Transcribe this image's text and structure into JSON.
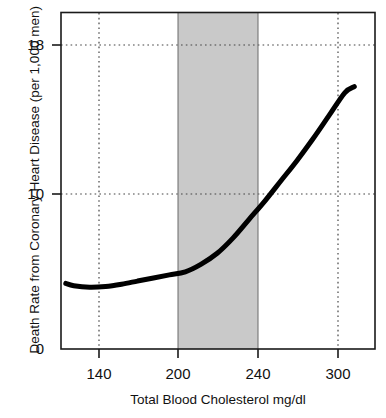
{
  "chart_data": {
    "type": "line",
    "title": "",
    "xlabel": "Total Blood Cholesterol mg/dl",
    "ylabel": "Death Rate from Coronary Heart Disease (per 1,000 men)",
    "xlim": [
      122,
      319
    ],
    "ylim": [
      0,
      21.8
    ],
    "xticks": [
      140,
      200,
      240,
      300
    ],
    "xticklabels": [
      "140",
      "200",
      "240",
      "300"
    ],
    "yticks": [
      0,
      10,
      18
    ],
    "yticklabels": [
      "0",
      "10",
      "18"
    ],
    "grid": "dotted gridlines at x ticks 140 and 300, and at y ticks 10 and 18",
    "legend": "none",
    "series": [
      {
        "name": "Death rate from coronary heart disease",
        "x": [
          125,
          130,
          140,
          150,
          160,
          170,
          180,
          190,
          200,
          210,
          220,
          230,
          240,
          250,
          260,
          270,
          280,
          290,
          300,
          306
        ],
        "values": [
          4.25,
          4.1,
          4.0,
          4.05,
          4.2,
          4.4,
          4.6,
          4.8,
          5.0,
          5.5,
          6.2,
          7.2,
          8.4,
          9.6,
          10.9,
          12.2,
          13.6,
          15.1,
          16.6,
          17.0
        ],
        "color": "#000000",
        "linewidth": 5
      }
    ],
    "shaded_regions": [
      {
        "name": "borderline-high-range",
        "axis": "x",
        "from": 200,
        "to": 240,
        "color": "#c9c9c9",
        "label": ""
      }
    ],
    "annotations": []
  },
  "axes": {
    "frame_color": "#1a1a1a",
    "gridline_color": "#555555",
    "background": "#ffffff"
  }
}
